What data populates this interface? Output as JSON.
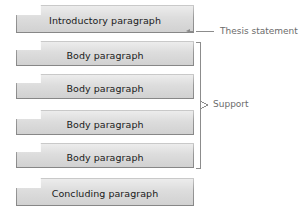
{
  "diagram": {
    "type": "essay-structure",
    "blocks": [
      {
        "id": "introductory",
        "label": "Introductory paragraph",
        "x": 16,
        "y": 5,
        "width": 178,
        "height": 28
      },
      {
        "id": "body-1",
        "label": "Body paragraph",
        "x": 16,
        "y": 41,
        "width": 178,
        "height": 25
      },
      {
        "id": "body-2",
        "label": "Body paragraph",
        "x": 16,
        "y": 74,
        "width": 178,
        "height": 25
      },
      {
        "id": "body-3",
        "label": "Body paragraph",
        "x": 16,
        "y": 110,
        "width": 178,
        "height": 25
      },
      {
        "id": "body-4",
        "label": "Body paragraph",
        "x": 16,
        "y": 143,
        "width": 178,
        "height": 25
      },
      {
        "id": "concluding",
        "label": "Concluding paragraph",
        "x": 16,
        "y": 178,
        "width": 178,
        "height": 28
      }
    ],
    "annotations": [
      {
        "id": "thesis-statement",
        "label": "Thesis statement",
        "label_x": 220,
        "label_y": 26,
        "leader_x1": 214,
        "leader_x2": 196,
        "leader_y": 31,
        "arrow_x": 186,
        "arrow_y": 31,
        "elbow_x": 194
      },
      {
        "id": "support",
        "label": "Support",
        "label_x": 213,
        "label_y": 99,
        "bracket_x": 200,
        "bracket_top": 42,
        "bracket_bottom": 168,
        "tick_y": 105,
        "tick_x2": 208
      }
    ],
    "colors": {
      "block_fill": "#d9d9d9",
      "block_stroke": "#8c8c8c",
      "block_text": "#1a1a1a",
      "annotation_text": "#6b6b6b",
      "annotation_line": "#8c8c8c",
      "background": "#ffffff"
    }
  }
}
